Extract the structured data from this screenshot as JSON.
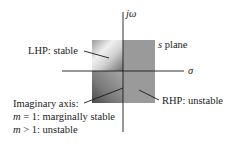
{
  "diagram": {
    "title": "s plane",
    "axes": {
      "vertical_label": "jω",
      "horizontal_label": "σ"
    },
    "regions": {
      "lhp": "LHP: stable",
      "rhp": "RHP: unstable"
    },
    "imaginary_axis_note": {
      "line1": "Imaginary axis:",
      "line2_var": "m",
      "line2_rest": " = 1: marginally stable",
      "line3_var": "m",
      "line3_rest": " > 1: unstable"
    },
    "plane_label_var": "s",
    "plane_label_rest": " plane",
    "colors": {
      "axis": "#1a1a1a",
      "rhp_fill": "#9a9a9a",
      "lhp_light": "#eeeeee",
      "lhp_dark": "#5a5a5a"
    }
  }
}
